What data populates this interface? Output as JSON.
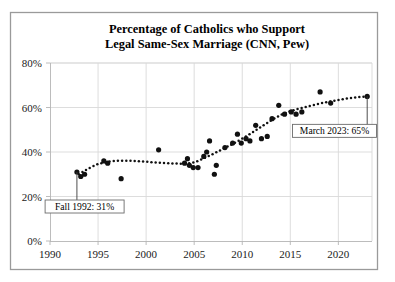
{
  "chart_data": {
    "type": "scatter",
    "title": "Percentage of Catholics who Support Legal Same-Sex Marriage (CNN, Pew)",
    "title_line_1": "Percentage of Catholics who Support",
    "title_line_2": "Legal Same-Sex Marriage (CNN, Pew)",
    "xlabel": "",
    "ylabel": "",
    "xlim": [
      1990,
      2023.5
    ],
    "ylim": [
      0,
      80
    ],
    "grid": true,
    "legend": "none",
    "y_ticks": [
      0,
      20,
      40,
      60,
      80
    ],
    "y_tick_labels": [
      "0%",
      "20%",
      "40%",
      "60%",
      "80%"
    ],
    "x_ticks": [
      1990,
      1995,
      2000,
      2005,
      2010,
      2015,
      2020
    ],
    "x_tick_labels": [
      "1990",
      "1995",
      "2000",
      "2005",
      "2010",
      "2015",
      "2020"
    ],
    "points": [
      {
        "x": 1992.8,
        "y": 31
      },
      {
        "x": 1993.2,
        "y": 29
      },
      {
        "x": 1993.6,
        "y": 30
      },
      {
        "x": 1995.6,
        "y": 36
      },
      {
        "x": 1996.0,
        "y": 35
      },
      {
        "x": 1997.4,
        "y": 28
      },
      {
        "x": 2001.3,
        "y": 41
      },
      {
        "x": 2004.0,
        "y": 35
      },
      {
        "x": 2004.3,
        "y": 37
      },
      {
        "x": 2004.5,
        "y": 34
      },
      {
        "x": 2004.9,
        "y": 33
      },
      {
        "x": 2005.4,
        "y": 33
      },
      {
        "x": 2006.0,
        "y": 38
      },
      {
        "x": 2006.3,
        "y": 40
      },
      {
        "x": 2006.6,
        "y": 45
      },
      {
        "x": 2007.1,
        "y": 30
      },
      {
        "x": 2007.3,
        "y": 34
      },
      {
        "x": 2008.2,
        "y": 42
      },
      {
        "x": 2009.0,
        "y": 44
      },
      {
        "x": 2009.5,
        "y": 48
      },
      {
        "x": 2009.9,
        "y": 44
      },
      {
        "x": 2010.4,
        "y": 46
      },
      {
        "x": 2010.8,
        "y": 45
      },
      {
        "x": 2011.4,
        "y": 52
      },
      {
        "x": 2012.0,
        "y": 46
      },
      {
        "x": 2012.6,
        "y": 47
      },
      {
        "x": 2013.1,
        "y": 55
      },
      {
        "x": 2013.8,
        "y": 61
      },
      {
        "x": 2014.4,
        "y": 57
      },
      {
        "x": 2015.1,
        "y": 58
      },
      {
        "x": 2015.6,
        "y": 57
      },
      {
        "x": 2016.2,
        "y": 58
      },
      {
        "x": 2018.1,
        "y": 67
      },
      {
        "x": 2019.2,
        "y": 62
      },
      {
        "x": 2023.0,
        "y": 65
      }
    ],
    "trend": [
      {
        "x": 1993.0,
        "y": 30.0
      },
      {
        "x": 1994.0,
        "y": 32.6
      },
      {
        "x": 1995.0,
        "y": 34.6
      },
      {
        "x": 1996.0,
        "y": 35.7
      },
      {
        "x": 1997.0,
        "y": 36.1
      },
      {
        "x": 1998.0,
        "y": 36.1
      },
      {
        "x": 1999.0,
        "y": 35.9
      },
      {
        "x": 2000.0,
        "y": 35.6
      },
      {
        "x": 2001.0,
        "y": 35.3
      },
      {
        "x": 2002.0,
        "y": 35.0
      },
      {
        "x": 2003.0,
        "y": 34.8
      },
      {
        "x": 2004.0,
        "y": 34.7
      },
      {
        "x": 2005.0,
        "y": 35.3
      },
      {
        "x": 2006.0,
        "y": 37.1
      },
      {
        "x": 2007.0,
        "y": 39.2
      },
      {
        "x": 2008.0,
        "y": 41.4
      },
      {
        "x": 2009.0,
        "y": 43.6
      },
      {
        "x": 2010.0,
        "y": 46.0
      },
      {
        "x": 2011.0,
        "y": 48.6
      },
      {
        "x": 2012.0,
        "y": 51.4
      },
      {
        "x": 2013.0,
        "y": 54.2
      },
      {
        "x": 2014.0,
        "y": 56.6
      },
      {
        "x": 2015.0,
        "y": 58.4
      },
      {
        "x": 2016.0,
        "y": 59.6
      },
      {
        "x": 2017.0,
        "y": 60.7
      },
      {
        "x": 2018.0,
        "y": 61.7
      },
      {
        "x": 2019.0,
        "y": 62.6
      },
      {
        "x": 2020.0,
        "y": 63.4
      },
      {
        "x": 2021.0,
        "y": 64.1
      },
      {
        "x": 2022.0,
        "y": 64.6
      },
      {
        "x": 2023.0,
        "y": 65.0
      }
    ],
    "annotations": [
      {
        "name": "annotation-fall-1992",
        "label": "Fall 1992: 31%",
        "point_x": 1992.8,
        "point_y": 31,
        "box_x": 1993.6,
        "box_y": 15.5
      },
      {
        "name": "annotation-march-2023",
        "label": "March 2023: 65%",
        "point_x": 2023.0,
        "point_y": 65,
        "box_x": 2019.6,
        "box_y": 49.5
      }
    ]
  },
  "colors": {
    "point": "#111111",
    "trend": "#111111",
    "grid": "#d9d9d9",
    "frame": "#9a9a9a",
    "text": "#000000"
  }
}
